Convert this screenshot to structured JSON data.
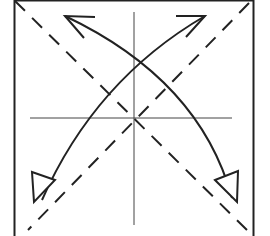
{
  "diagram": {
    "colors": {
      "line": "#222222",
      "background": "#ffffff",
      "guide": "#555555"
    },
    "square": {
      "x": 14,
      "y": 1,
      "size": 239
    },
    "elements": [
      {
        "type": "square-outline",
        "name": "paper-square"
      },
      {
        "type": "valley-fold",
        "name": "diagonal-tl-br"
      },
      {
        "type": "valley-fold",
        "name": "diagonal-tr-bl"
      },
      {
        "type": "crease",
        "name": "vertical-center-crease"
      },
      {
        "type": "crease",
        "name": "horizontal-center-crease"
      },
      {
        "type": "fold-arrow",
        "name": "arrow-to-top-left",
        "head": "open"
      },
      {
        "type": "fold-arrow",
        "name": "arrow-to-top-right",
        "head": "open"
      },
      {
        "type": "unfold-arrow",
        "name": "arrow-to-bottom-left",
        "head": "hollow-triangle"
      },
      {
        "type": "unfold-arrow",
        "name": "arrow-to-bottom-right",
        "head": "hollow-triangle"
      }
    ]
  }
}
